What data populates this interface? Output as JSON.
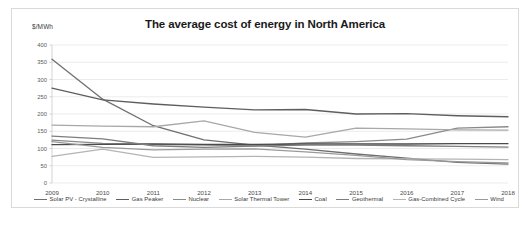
{
  "chart_data": {
    "type": "line",
    "title": "The average cost of energy in North America",
    "xlabel": "",
    "ylabel": "$/MWh",
    "ylim": [
      0,
      400
    ],
    "ytick_step": 50,
    "yticks": [
      "400",
      "350",
      "300",
      "250",
      "200",
      "150",
      "100",
      "50",
      "0"
    ],
    "grid": true,
    "legend_position": "bottom",
    "categories": [
      "2009",
      "2010",
      "2011",
      "2012",
      "2013",
      "2014",
      "2015",
      "2016",
      "2017",
      "2018"
    ],
    "series": [
      {
        "name": "Solar PV - Crystalline",
        "color": "#6f6f6f",
        "values": [
          359,
          243,
          166,
          125,
          110,
          98,
          84,
          72,
          60,
          55
        ]
      },
      {
        "name": "Gas Peaker",
        "color": "#5e5e5e",
        "values": [
          275,
          241,
          229,
          220,
          212,
          213,
          200,
          201,
          195,
          192
        ]
      },
      {
        "name": "Nuclear",
        "color": "#8a8a8a",
        "values": [
          124,
          115,
          112,
          110,
          108,
          116,
          120,
          127,
          159,
          163
        ]
      },
      {
        "name": "Solar Thermal Tower",
        "color": "#a8a8a8",
        "values": [
          168,
          165,
          163,
          180,
          147,
          133,
          159,
          157,
          154,
          153
        ]
      },
      {
        "name": "Coal",
        "color": "#4a4a4a",
        "values": [
          111,
          112,
          113,
          112,
          112,
          113,
          113,
          113,
          114,
          114
        ]
      },
      {
        "name": "Geothermal",
        "color": "#7d7d7d",
        "values": [
          136,
          128,
          108,
          103,
          107,
          110,
          110,
          108,
          106,
          104
        ]
      },
      {
        "name": "Gas-Combined Cycle",
        "color": "#b4b4b4",
        "values": [
          77,
          98,
          74,
          76,
          77,
          75,
          71,
          70,
          69,
          68
        ]
      },
      {
        "name": "Wind",
        "color": "#9a9a9a",
        "values": [
          120,
          103,
          96,
          98,
          99,
          90,
          80,
          68,
          62,
          58
        ]
      }
    ]
  },
  "legend": {
    "items": [
      {
        "label": "Solar PV - Crystalline"
      },
      {
        "label": "Gas Peaker"
      },
      {
        "label": "Nuclear"
      },
      {
        "label": "Solar Thermal Tower"
      },
      {
        "label": "Coal"
      },
      {
        "label": "Geothermal"
      },
      {
        "label": "Gas-Combined Cycle"
      },
      {
        "label": "Wind"
      }
    ]
  }
}
